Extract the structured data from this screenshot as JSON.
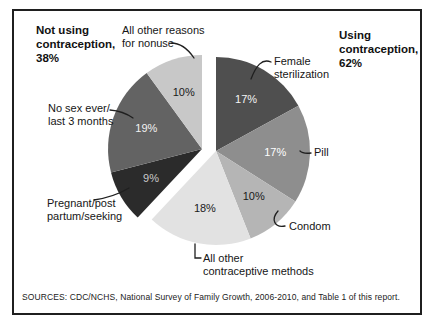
{
  "annotations": {
    "not_using": "Not using\ncontraception,\n38%",
    "using": "Using\ncontraception,\n62%"
  },
  "callouts": {
    "nonuse_other": "All other reasons\nfor nonuse",
    "female_sterilization": "Female\nsterilization",
    "pill": "Pill",
    "condom": "Condom",
    "all_other_methods": "All other\ncontraceptive methods",
    "pregnant": "Pregnant/post\npartum/seeking",
    "no_sex": "No sex ever/\nlast 3 months"
  },
  "source_note": "SOURCES: CDC/NCHS, National Survey of Family Growth, 2006-2010, and Table 1 of this report.",
  "chart_data": {
    "type": "pie",
    "title": "",
    "direction": "clockwise",
    "start_angle_deg": 0,
    "exploded": true,
    "groups": [
      {
        "id": "using",
        "label": "Using contraception",
        "total_pct": 62
      },
      {
        "id": "not_using",
        "label": "Not using contraception",
        "total_pct": 38
      }
    ],
    "slices": [
      {
        "label": "Female sterilization",
        "value": 17,
        "pct_label": "17%",
        "group": "using",
        "color": "#4f4f4f",
        "pct_label_color": "#f5f5f5"
      },
      {
        "label": "Pill",
        "value": 17,
        "pct_label": "17%",
        "group": "using",
        "color": "#8e8e8e",
        "pct_label_color": "#ffffff"
      },
      {
        "label": "Condom",
        "value": 10,
        "pct_label": "10%",
        "group": "using",
        "color": "#b5b5b5",
        "pct_label_color": "#1a1a1a"
      },
      {
        "label": "All other contraceptive methods",
        "value": 18,
        "pct_label": "18%",
        "group": "using",
        "color": "#e2e2e2",
        "pct_label_color": "#1a1a1a"
      },
      {
        "label": "Pregnant/post partum/seeking",
        "value": 9,
        "pct_label": "9%",
        "group": "not_using",
        "color": "#2b2b2b",
        "pct_label_color": "#c9c9c9"
      },
      {
        "label": "No sex ever/last 3 months",
        "value": 19,
        "pct_label": "19%",
        "group": "not_using",
        "color": "#636363",
        "pct_label_color": "#f2f2f2"
      },
      {
        "label": "All other reasons for nonuse",
        "value": 10,
        "pct_label": "10%",
        "group": "not_using",
        "color": "#c8c8c8",
        "pct_label_color": "#1a1a1a"
      }
    ]
  }
}
